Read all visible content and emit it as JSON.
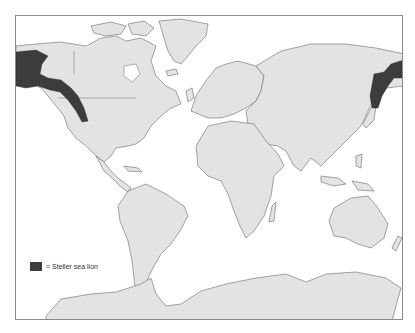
{
  "map": {
    "projection": "world (Miller-like)",
    "background_color": "#ffffff",
    "land_color": "#e3e3e3",
    "border_color": "#6a6a6a",
    "highlight_color": "#3c3c3c",
    "highlighted_regions": [
      "North Pacific coast of North America (Alaska to California)",
      "Aleutian Islands / Bering Sea",
      "Kamchatka, Sea of Okhotsk, Kuril Islands, northern Japan"
    ]
  },
  "legend": {
    "swatch_color": "#3c3c3c",
    "label": "= Steller sea lion"
  }
}
